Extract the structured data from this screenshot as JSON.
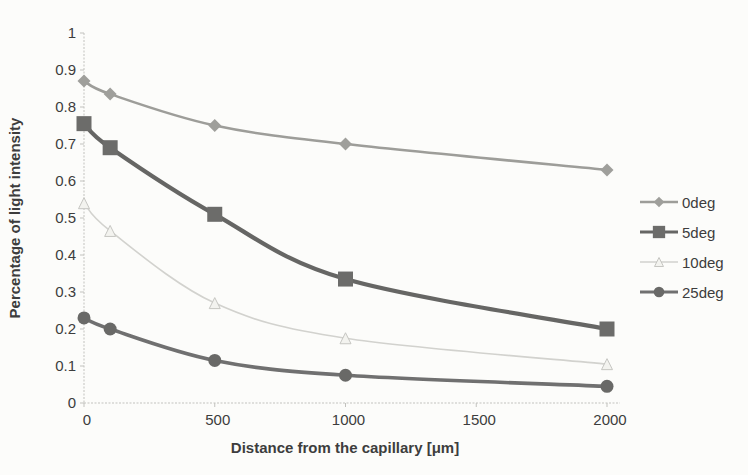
{
  "chart_data": {
    "type": "line",
    "x": [
      0,
      100,
      500,
      1000,
      2000
    ],
    "series": [
      {
        "name": "0deg",
        "marker": "diamond",
        "color": "#9d9d99",
        "marker_color": "#9f9f9b",
        "line_width": 2.6,
        "marker_size": 13,
        "values": [
          0.87,
          0.835,
          0.75,
          0.7,
          0.63
        ]
      },
      {
        "name": "5deg",
        "marker": "square",
        "color": "#666664",
        "marker_color": "#6c6c6a",
        "line_width": 4.2,
        "marker_size": 15,
        "values": [
          0.755,
          0.69,
          0.51,
          0.335,
          0.2
        ]
      },
      {
        "name": "10deg",
        "marker": "triangle",
        "color": "#d2d2ce",
        "marker_color": "#c6c6c2",
        "line_width": 1.6,
        "marker_size": 11,
        "values": [
          0.54,
          0.465,
          0.27,
          0.175,
          0.105
        ]
      },
      {
        "name": "25deg",
        "marker": "circle",
        "color": "#707070",
        "marker_color": "#696967",
        "line_width": 3.6,
        "marker_size": 13,
        "values": [
          0.23,
          0.2,
          0.115,
          0.075,
          0.045
        ]
      }
    ],
    "title": "",
    "xlabel": "Distance from the capillary [μm]",
    "ylabel": "Percentage of light intensity",
    "xlim": [
      0,
      2000
    ],
    "ylim": [
      0,
      1
    ],
    "x_ticks": [
      0,
      500,
      1000,
      1500,
      2000
    ],
    "x_tick_labels": [
      "0",
      "500",
      "1000",
      "1500",
      "2000"
    ],
    "y_ticks": [
      0,
      0.1,
      0.2,
      0.3,
      0.4,
      0.5,
      0.6,
      0.7,
      0.8,
      0.9,
      1
    ],
    "y_tick_labels": [
      "0",
      "0.1",
      "0.2",
      "0.3",
      "0.4",
      "0.5",
      "0.6",
      "0.7",
      "0.8",
      "0.9",
      "1"
    ],
    "grid": false,
    "legend_position": "right",
    "legend_labels": [
      "0deg",
      "5deg",
      "10deg",
      "25deg"
    ]
  },
  "colors": {
    "background": "#fcfcfa",
    "axis_line": "#c2c2be",
    "tick_text": "#3d3d3d",
    "triangle_fill": "#f3f3ef"
  },
  "layout_values": {
    "plot_left_px": 84,
    "plot_right_px": 607,
    "plot_top_px": 33,
    "plot_bottom_px": 403
  }
}
